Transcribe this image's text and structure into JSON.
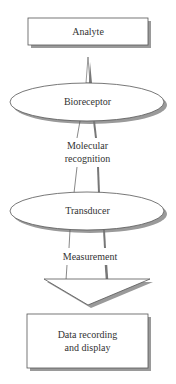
{
  "diagram": {
    "nodes": [
      {
        "id": "analyte",
        "shape": "rectangle",
        "label": "Analyte"
      },
      {
        "id": "bioreceptor",
        "shape": "ellipse",
        "label": "Bioreceptor"
      },
      {
        "id": "transducer",
        "shape": "ellipse",
        "label": "Transducer"
      },
      {
        "id": "output",
        "shape": "rectangle",
        "label_line1": "Data recording",
        "label_line2": "and display"
      }
    ],
    "edges": [
      {
        "from": "analyte",
        "to": "bioreceptor",
        "label": ""
      },
      {
        "from": "bioreceptor",
        "to": "transducer",
        "label_line1": "Molecular",
        "label_line2": "recognition"
      },
      {
        "from": "transducer",
        "to": "output",
        "label": "Measurement"
      }
    ],
    "colors": {
      "stroke": "#555555",
      "shadow": "#9a9a9a",
      "fill": "#ffffff"
    }
  }
}
